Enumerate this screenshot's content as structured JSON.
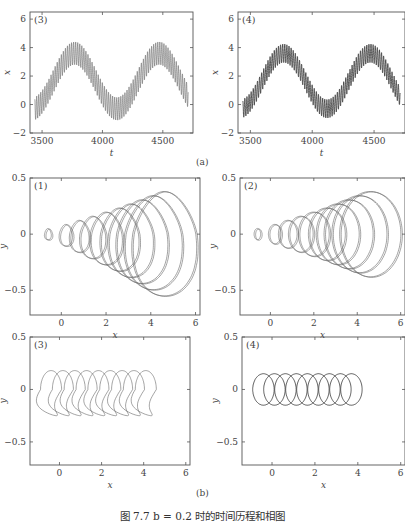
{
  "figure": {
    "caption": "图 7.7   b = 0.2 时的时间历程和相图",
    "subfig_a_label": "(a)",
    "subfig_b_label": "(b)"
  },
  "chart_data": [
    {
      "id": "a3",
      "type": "line",
      "panel_label": "(3)",
      "title": "",
      "xlabel": "t",
      "ylabel": "x",
      "xlim": [
        3400,
        4750
      ],
      "ylim": [
        -2,
        6.5
      ],
      "xticks": [
        3500,
        4000,
        4500
      ],
      "yticks": [
        -2,
        0,
        2,
        4,
        6
      ],
      "description": "Time history: slow sinusoid between ~0 and ~3.8 (period ~700) with fast oscillation of amplitude ~0.7",
      "series": [
        {
          "name": "x(t)",
          "slow_period": 700,
          "slow_min": -0.3,
          "slow_max": 3.6,
          "fast_amplitude": 0.8,
          "color": "#888888"
        }
      ]
    },
    {
      "id": "a4",
      "type": "line",
      "panel_label": "(4)",
      "title": "",
      "xlabel": "t",
      "ylabel": "x",
      "xlim": [
        3400,
        4750
      ],
      "ylim": [
        -2,
        6.5
      ],
      "xticks": [
        3500,
        4000,
        4500
      ],
      "yticks": [
        -2,
        0,
        2,
        4,
        6
      ],
      "description": "Time history: slow sinusoid between ~0 and ~3.7 with fast oscillation, darker traces",
      "series": [
        {
          "name": "x(t)",
          "slow_period": 700,
          "slow_min": -0.3,
          "slow_max": 3.6,
          "fast_amplitude": 0.65,
          "color": "#333333"
        }
      ]
    },
    {
      "id": "b1",
      "type": "line",
      "panel_label": "(1)",
      "xlabel": "x",
      "ylabel": "y",
      "xlim": [
        -1.4,
        6.2
      ],
      "ylim": [
        -0.72,
        0.5
      ],
      "xticks": [
        0,
        2,
        4,
        6
      ],
      "yticks": [
        -0.5,
        0,
        0.5
      ],
      "description": "Phase portrait: nested loops growing from x≈-0.7 to x≈5.8, y range ≈ -0.55 to 0.38, asymmetric lower lobes",
      "series": [
        {
          "name": "phase",
          "loop_centers": [
            -0.6,
            0.2,
            0.8,
            1.4,
            2.0,
            2.6,
            3.1,
            3.6,
            4.1,
            4.6
          ],
          "max_y": 0.38,
          "min_y": -0.55
        }
      ]
    },
    {
      "id": "b2",
      "type": "line",
      "panel_label": "(2)",
      "xlabel": "x",
      "ylabel": "y",
      "xlim": [
        -1.4,
        6.2
      ],
      "ylim": [
        -0.72,
        0.5
      ],
      "xticks": [
        0,
        2,
        4,
        6
      ],
      "yticks": [
        -0.5,
        0,
        0.5
      ],
      "description": "Phase portrait: symmetric nested cone-shaped loops from x≈-0.7 to x≈5.8, y range ≈ ±0.38",
      "series": [
        {
          "name": "phase",
          "loop_centers": [
            -0.6,
            0.2,
            0.8,
            1.4,
            2.0,
            2.6,
            3.1,
            3.6,
            4.1,
            4.6
          ],
          "max_y": 0.38,
          "min_y": -0.38
        }
      ]
    },
    {
      "id": "b3",
      "type": "line",
      "panel_label": "(3)",
      "xlabel": "x",
      "ylabel": "y",
      "xlim": [
        -1.4,
        6.2
      ],
      "ylim": [
        -0.72,
        0.5
      ],
      "xticks": [
        0,
        2,
        4,
        6
      ],
      "yticks": [
        -0.5,
        0,
        0.5
      ],
      "description": "Phase portrait: band of overlapping asymmetric loops from x≈-0.9 to x≈4.6, y ≈ -0.25 to 0.18",
      "series": [
        {
          "name": "phase",
          "x_range": [
            -0.9,
            4.6
          ],
          "max_y": 0.18,
          "min_y": -0.25
        }
      ]
    },
    {
      "id": "b4",
      "type": "line",
      "panel_label": "(4)",
      "xlabel": "x",
      "ylabel": "y",
      "xlim": [
        -1.4,
        6.2
      ],
      "ylim": [
        -0.72,
        0.5
      ],
      "xticks": [
        0,
        2,
        4,
        6
      ],
      "yticks": [
        -0.5,
        0,
        0.5
      ],
      "description": "Phase portrait: band of overlapping near-circular loops from x≈-0.9 to x≈4.2, y ≈ ±0.15",
      "series": [
        {
          "name": "phase",
          "x_range": [
            -0.9,
            4.2
          ],
          "max_y": 0.15,
          "min_y": -0.15
        }
      ]
    }
  ]
}
